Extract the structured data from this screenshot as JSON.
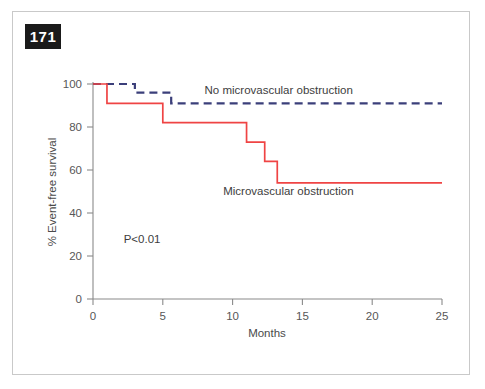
{
  "figure": {
    "panel_label": "171",
    "background_color": "#ffffff",
    "frame_border_color": "#c9c9c9",
    "badge_background_color": "#1a1a1a",
    "badge_text_color": "#ffffff"
  },
  "chart_data": {
    "type": "line",
    "subtype": "kaplan-meier-step",
    "title": "",
    "xlabel": "Months",
    "ylabel": "% Event-free survival",
    "xlim": [
      0,
      25
    ],
    "ylim": [
      0,
      100
    ],
    "xticks": [
      0,
      5,
      10,
      15,
      20,
      25
    ],
    "xtick_labels": [
      "0",
      "5",
      "10",
      "15",
      "20",
      "25"
    ],
    "yticks": [
      0,
      20,
      40,
      60,
      80,
      100
    ],
    "ytick_labels": [
      "0",
      "20",
      "40",
      "60",
      "80",
      "100"
    ],
    "grid": false,
    "legend_position": "inline-annotation",
    "annotations": [
      {
        "text": "P<0.01",
        "x": 2.2,
        "y": 26
      }
    ],
    "series": [
      {
        "name": "No microvascular obstruction",
        "color": "#3b3f7a",
        "line_style": "dashed",
        "label_x": 13.3,
        "label_y": 95.5,
        "points": [
          {
            "x": 0,
            "y": 100
          },
          {
            "x": 3.0,
            "y": 100
          },
          {
            "x": 3.0,
            "y": 96
          },
          {
            "x": 5.6,
            "y": 96
          },
          {
            "x": 5.6,
            "y": 91
          },
          {
            "x": 25,
            "y": 91
          }
        ]
      },
      {
        "name": "Microvascular obstruction",
        "color": "#ef4444",
        "line_style": "solid",
        "label_x": 14.0,
        "label_y": 48.5,
        "points": [
          {
            "x": 0,
            "y": 100
          },
          {
            "x": 1.0,
            "y": 100
          },
          {
            "x": 1.0,
            "y": 91
          },
          {
            "x": 5.0,
            "y": 91
          },
          {
            "x": 5.0,
            "y": 82
          },
          {
            "x": 11.0,
            "y": 82
          },
          {
            "x": 11.0,
            "y": 73
          },
          {
            "x": 12.3,
            "y": 73
          },
          {
            "x": 12.3,
            "y": 64
          },
          {
            "x": 13.2,
            "y": 64
          },
          {
            "x": 13.2,
            "y": 54
          },
          {
            "x": 25,
            "y": 54
          }
        ]
      }
    ]
  }
}
